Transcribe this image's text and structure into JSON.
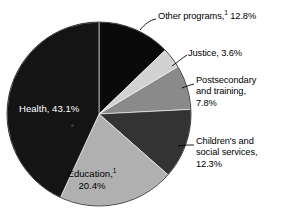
{
  "chart_data": {
    "type": "pie",
    "title": "",
    "subtitle": "",
    "xlabel": "",
    "ylabel": "",
    "legend_position": "none",
    "grid": false,
    "units": "percent",
    "start_angle_deg": 0,
    "direction": "clockwise",
    "categories": [
      "Other programs",
      "Justice",
      "Postsecondary and training",
      "Children's and social services",
      "Education",
      "Health"
    ],
    "values": [
      12.8,
      3.6,
      7.8,
      12.3,
      20.4,
      43.1
    ],
    "colors": [
      "#0a0a0a",
      "#d2d2d2",
      "#8a8a8a",
      "#333333",
      "#b0b0b0",
      "#141414"
    ],
    "slices": [
      {
        "name": "Other programs",
        "value": 12.8,
        "color": "#0a0a0a",
        "label_placement": "outside",
        "footnote": "1"
      },
      {
        "name": "Justice",
        "value": 3.6,
        "color": "#d2d2d2",
        "label_placement": "outside",
        "footnote": ""
      },
      {
        "name": "Postsecondary and training",
        "value": 7.8,
        "color": "#8a8a8a",
        "label_placement": "outside",
        "footnote": ""
      },
      {
        "name": "Children's and social services",
        "value": 12.3,
        "color": "#333333",
        "label_placement": "outside",
        "footnote": ""
      },
      {
        "name": "Education",
        "value": 20.4,
        "color": "#b0b0b0",
        "label_placement": "inside",
        "footnote": "1"
      },
      {
        "name": "Health",
        "value": 43.1,
        "color": "#141414",
        "label_placement": "inside",
        "footnote": ""
      }
    ]
  },
  "labels": {
    "other_programs_pre": "Other programs,",
    "other_programs_sup": "1",
    "other_programs_post": " 12.8%",
    "justice": "Justice, 3.6%",
    "postsecondary": "Postsecondary\nand training,\n7.8%",
    "children": "Children's and\nsocial services,\n12.3%",
    "health": "Health, 43.1%",
    "education_pre": "Education,",
    "education_sup": "1",
    "education_post": "20.4%"
  }
}
